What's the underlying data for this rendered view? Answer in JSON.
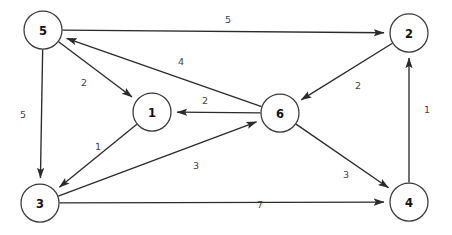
{
  "diagram": {
    "background_color": "#ffffff",
    "node_fill": "#ffffff",
    "node_stroke": "#3a3a3a",
    "edge_color": "#2b2b2b",
    "label_color": "#444444"
  },
  "chart_data": {
    "type": "diagram",
    "graph_type": "weighted-directed-graph",
    "directed": true,
    "weighted": true,
    "node_radius": 19,
    "nodes": [
      {
        "id": "5",
        "label": "5",
        "x": 43,
        "y": 30
      },
      {
        "id": "2",
        "label": "2",
        "x": 409,
        "y": 33
      },
      {
        "id": "1",
        "label": "1",
        "x": 152,
        "y": 112
      },
      {
        "id": "6",
        "label": "6",
        "x": 280,
        "y": 113
      },
      {
        "id": "3",
        "label": "3",
        "x": 40,
        "y": 203
      },
      {
        "id": "4",
        "label": "4",
        "x": 409,
        "y": 202
      }
    ],
    "edges": [
      {
        "from": "5",
        "to": "2",
        "weight": "5",
        "label_x": 228,
        "label_y": 19
      },
      {
        "from": "6",
        "to": "5",
        "weight": "4",
        "label_x": 181,
        "label_y": 61
      },
      {
        "from": "5",
        "to": "1",
        "weight": "2",
        "label_x": 84,
        "label_y": 82
      },
      {
        "from": "5",
        "to": "3",
        "weight": "5",
        "label_x": 23,
        "label_y": 114
      },
      {
        "from": "6",
        "to": "1",
        "weight": "2",
        "label_x": 205,
        "label_y": 100
      },
      {
        "from": "2",
        "to": "6",
        "weight": "2",
        "label_x": 358,
        "label_y": 85
      },
      {
        "from": "4",
        "to": "2",
        "weight": "1",
        "label_x": 427,
        "label_y": 109
      },
      {
        "from": "1",
        "to": "3",
        "weight": "1",
        "label_x": 98,
        "label_y": 146
      },
      {
        "from": "3",
        "to": "6",
        "weight": "3",
        "label_x": 196,
        "label_y": 165
      },
      {
        "from": "6",
        "to": "4",
        "weight": "3",
        "label_x": 346,
        "label_y": 174
      },
      {
        "from": "3",
        "to": "4",
        "weight": "7",
        "label_x": 260,
        "label_y": 204
      }
    ]
  }
}
